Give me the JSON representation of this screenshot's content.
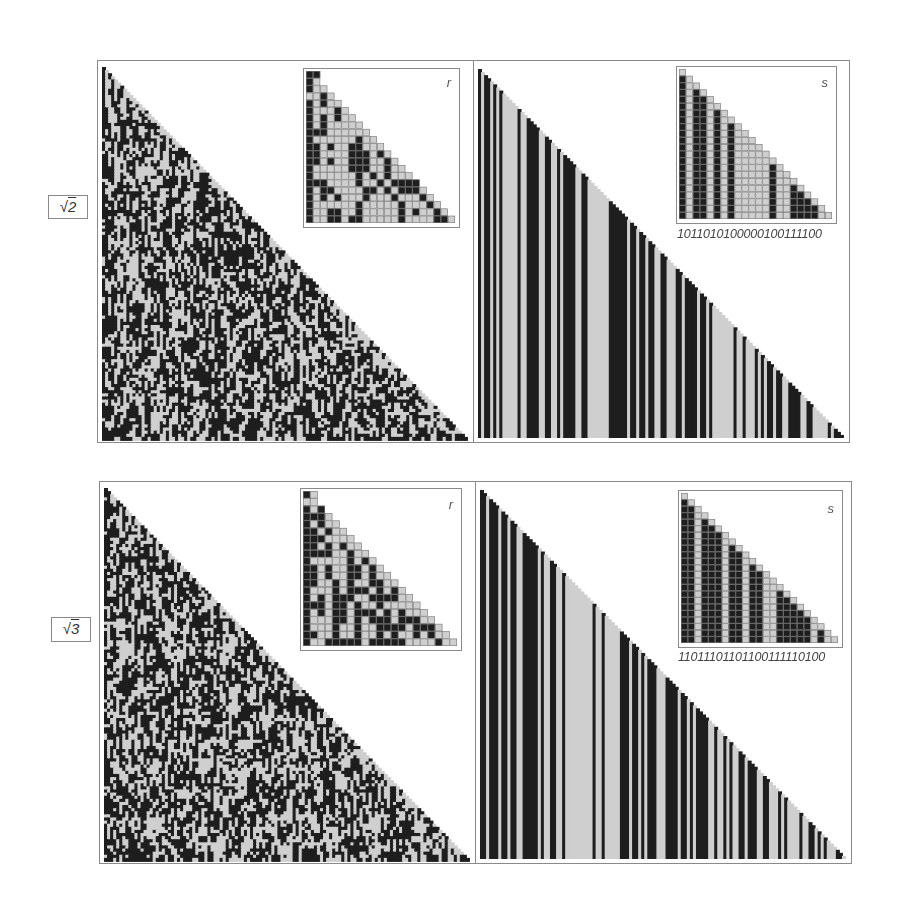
{
  "rows": [
    {
      "label": {
        "radical": "√",
        "number": "2"
      },
      "r_panel": {
        "inset_letter": "r"
      },
      "s_panel": {
        "inset_letter": "s",
        "digits": "1011010100000100111100"
      }
    },
    {
      "label": {
        "radical": "√",
        "number": "3"
      },
      "r_panel": {
        "inset_letter": "r"
      },
      "s_panel": {
        "inset_letter": "s",
        "digits": "11011101101100111110100"
      }
    }
  ],
  "colors": {
    "black": "#1e1e1e",
    "gray": "#cfcfcf",
    "border": "#8a8a8a",
    "grid": "#7a7a7a"
  }
}
